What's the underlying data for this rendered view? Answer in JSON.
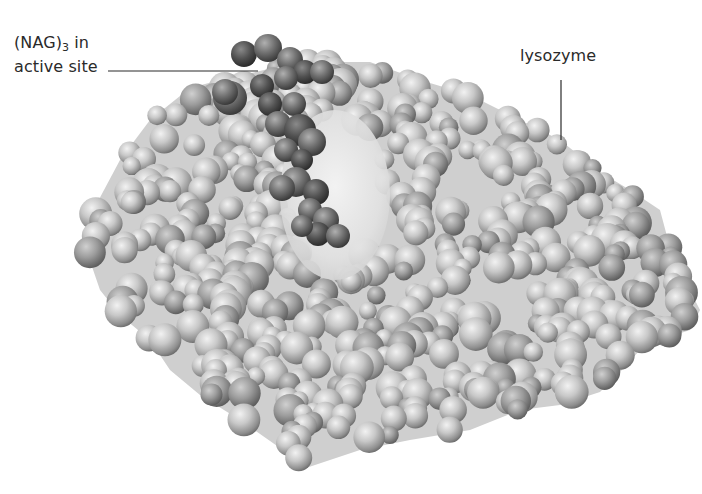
{
  "figure": {
    "labels": {
      "nag_prefix": "(NAG)",
      "nag_subscript": "3",
      "nag_suffix": " in",
      "nag_line2": "active site",
      "lysozyme": "lysozyme"
    },
    "colors": {
      "background": "#ffffff",
      "protein_light": "#e6e6e6",
      "protein_mid": "#b4b4b4",
      "protein_dark": "#7a7a7a",
      "ligand_light": "#9a9a9a",
      "ligand_dark": "#3e3e3e",
      "leader_line": "#2a2a2a"
    },
    "leaders": [
      {
        "name": "nag-leader",
        "x1": 108,
        "y1": 71,
        "x2": 258,
        "y2": 71
      },
      {
        "name": "lysozyme-leader",
        "x1": 561,
        "y1": 80,
        "x2": 561,
        "y2": 140
      }
    ],
    "protein_outline": "M96,205 L120,160 L150,120 L190,88 L220,80 L300,62 L370,62 L420,80 L470,95 L520,120 L560,140 L600,172 L630,190 L660,210 L668,240 L682,275 L700,310 L690,330 L660,340 L640,350 L620,372 L600,392 L560,405 L520,410 L470,430 L410,440 L360,450 L300,470 L290,455 L240,420 L200,395 L170,370 L150,340 L120,315 L100,290 L88,255 Z",
    "cleft": {
      "cx": 335,
      "cy": 195,
      "rx": 55,
      "ry": 85
    }
  }
}
